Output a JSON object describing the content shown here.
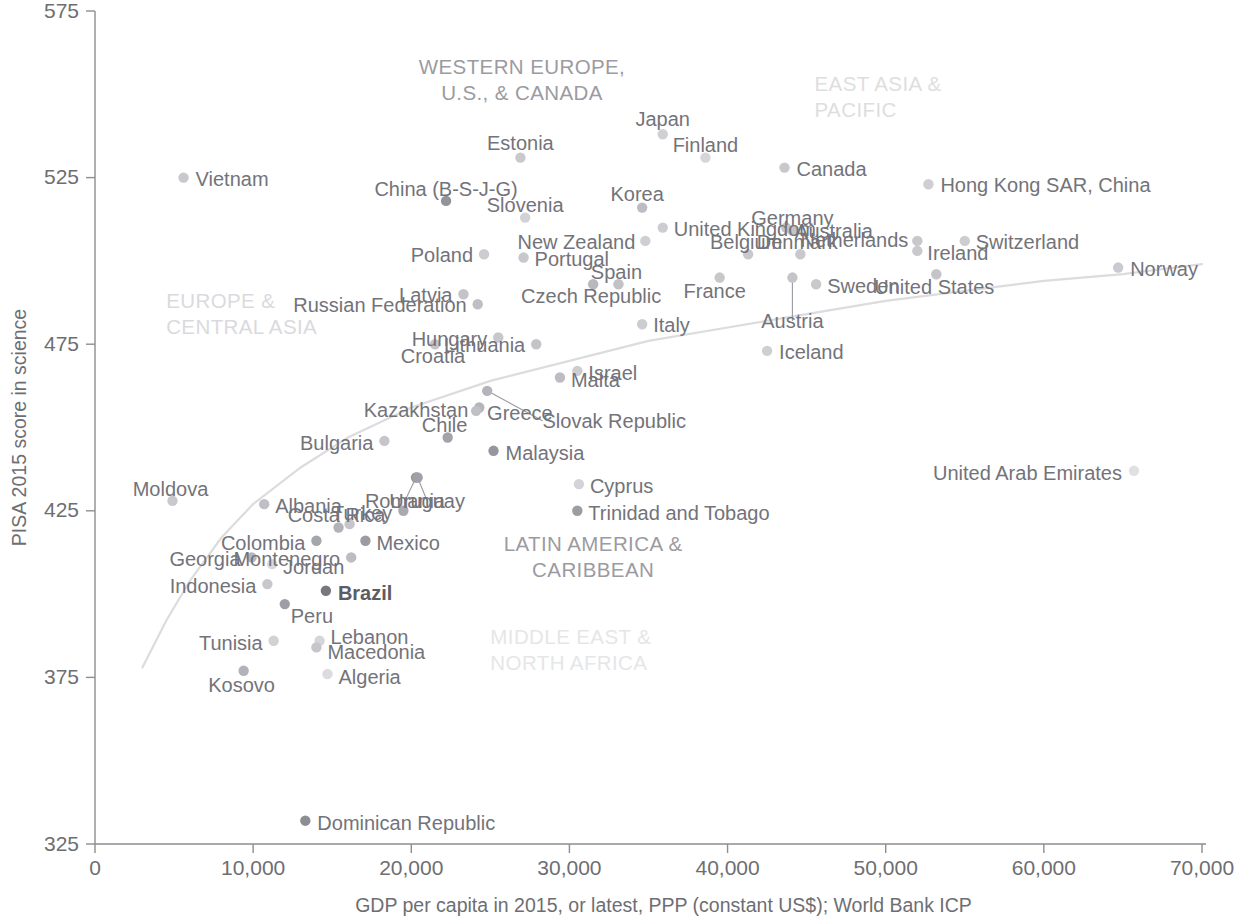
{
  "chart_data": {
    "type": "scatter",
    "title": "",
    "xlabel": "GDP per capita in 2015, or latest, PPP (constant US$); World Bank ICP",
    "ylabel": "PISA 2015 score in science",
    "xlim": [
      0,
      70000
    ],
    "ylim": [
      325,
      575
    ],
    "xticks": [
      "0",
      "10,000",
      "20,000",
      "30,000",
      "40,000",
      "50,000",
      "60,000",
      "70,000"
    ],
    "xtick_values": [
      0,
      10000,
      20000,
      30000,
      40000,
      50000,
      60000,
      70000
    ],
    "yticks": [
      "325",
      "375",
      "425",
      "475",
      "525",
      "575"
    ],
    "ytick_values": [
      325,
      375,
      425,
      475,
      525,
      575
    ],
    "grid": false,
    "legend": "none",
    "trend_line": {
      "label": "fitted logarithmic trend",
      "color": "#dcdcde",
      "points": [
        [
          3000,
          378
        ],
        [
          4500,
          392
        ],
        [
          6000,
          404
        ],
        [
          8000,
          417
        ],
        [
          10000,
          427
        ],
        [
          13000,
          438
        ],
        [
          16000,
          447
        ],
        [
          20000,
          456
        ],
        [
          25000,
          464
        ],
        [
          30000,
          470
        ],
        [
          35000,
          476
        ],
        [
          40000,
          480
        ],
        [
          45000,
          484
        ],
        [
          50000,
          488
        ],
        [
          55000,
          491
        ],
        [
          60000,
          494
        ],
        [
          65000,
          496
        ],
        [
          70000,
          499
        ]
      ]
    },
    "regions": [
      {
        "name": "WESTERN EUROPE, U.S., & CANADA",
        "lines": [
          "WESTERN EUROPE,",
          "U.S., & CANADA"
        ],
        "x": 27000,
        "y": 556,
        "color": "#9b9ba1",
        "align": "middle"
      },
      {
        "name": "EAST ASIA & PACIFIC",
        "lines": [
          "EAST ASIA &",
          "PACIFIC"
        ],
        "x": 45500,
        "y": 551,
        "color": "#dedee0",
        "align": "start"
      },
      {
        "name": "EUROPE & CENTRAL ASIA",
        "lines": [
          "EUROPE &",
          "CENTRAL ASIA"
        ],
        "x": 4500,
        "y": 486,
        "color": "#dadade",
        "align": "start"
      },
      {
        "name": "LATIN AMERICA & CARIBBEAN",
        "lines": [
          "LATIN AMERICA &",
          "CARIBBEAN"
        ],
        "x": 31500,
        "y": 413,
        "color": "#9b9ba1",
        "align": "middle"
      },
      {
        "name": "MIDDLE EAST & NORTH AFRICA",
        "lines": [
          "MIDDLE EAST &",
          "NORTH AFRICA"
        ],
        "x": 25000,
        "y": 385,
        "color": "#e6e6e8",
        "align": "start"
      }
    ],
    "points": [
      {
        "name": "Vietnam",
        "x": 5600,
        "y": 525,
        "shade": "#c9c9cd",
        "label_dx": 12,
        "label_dy": 1,
        "anchor": "start"
      },
      {
        "name": "Estonia",
        "x": 26900,
        "y": 531,
        "shade": "#c9c9cd",
        "label_dx": 0,
        "label_dy": -15,
        "anchor": "middle"
      },
      {
        "name": "Japan",
        "x": 35900,
        "y": 538,
        "shade": "#d0d0d4",
        "label_dx": 0,
        "label_dy": -15,
        "anchor": "middle"
      },
      {
        "name": "Canada",
        "x": 43600,
        "y": 528,
        "shade": "#c9c9cd",
        "label_dx": 12,
        "label_dy": 1,
        "anchor": "start"
      },
      {
        "name": "Finland",
        "x": 38600,
        "y": 531,
        "shade": "#d6d6da",
        "label_dx": 0,
        "label_dy": -13,
        "anchor": "middle"
      },
      {
        "name": "Hong Kong SAR, China",
        "x": 52700,
        "y": 523,
        "shade": "#cfcfd3",
        "label_dx": 12,
        "label_dy": 1,
        "anchor": "start"
      },
      {
        "name": "Korea",
        "x": 34600,
        "y": 516,
        "shade": "#bcbcc2",
        "label_dx": -5,
        "label_dy": -14,
        "anchor": "middle"
      },
      {
        "name": "United Kingdom",
        "x": 35900,
        "y": 510,
        "shade": "#cdcdd1",
        "label_dx": 11,
        "label_dy": 1,
        "anchor": "start"
      },
      {
        "name": "Slovenia",
        "x": 27200,
        "y": 513,
        "shade": "#d2d2d6",
        "label_dx": 0,
        "label_dy": -13,
        "anchor": "middle"
      },
      {
        "name": "China (B-S-J-G)",
        "x": 22200,
        "y": 518,
        "shade": "#939399",
        "label_dx": 0,
        "label_dy": -12,
        "anchor": "middle"
      },
      {
        "name": "Germany",
        "x": 44100,
        "y": 509,
        "shade": "#c3c3c8",
        "label_dx": 0,
        "label_dy": -13,
        "anchor": "middle"
      },
      {
        "name": "Australia",
        "x": 43700,
        "y": 510,
        "shade": "#c3c3c8",
        "label_dx": 9,
        "label_dy": 3,
        "anchor": "start"
      },
      {
        "name": "New Zealand",
        "x": 34800,
        "y": 506,
        "shade": "#cfcfd3",
        "label_dx": -10,
        "label_dy": 1,
        "anchor": "end"
      },
      {
        "name": "Netherlands",
        "x": 52000,
        "y": 506,
        "shade": "#c7c7cc",
        "label_dx": -9,
        "label_dy": -1,
        "anchor": "end"
      },
      {
        "name": "Switzerland",
        "x": 55000,
        "y": 506,
        "shade": "#cdcdd1",
        "label_dx": 11,
        "label_dy": 1,
        "anchor": "start"
      },
      {
        "name": "Portugal",
        "x": 27100,
        "y": 501,
        "shade": "#c7c7cc",
        "label_dx": 11,
        "label_dy": 1,
        "anchor": "start"
      },
      {
        "name": "Poland",
        "x": 24600,
        "y": 502,
        "shade": "#cdcdd1",
        "label_dx": -11,
        "label_dy": 1,
        "anchor": "end"
      },
      {
        "name": "Denmark",
        "x": 44600,
        "y": 502,
        "shade": "#c9c9cd",
        "label_dx": -3,
        "label_dy": -12,
        "anchor": "middle"
      },
      {
        "name": "Ireland",
        "x": 52000,
        "y": 503,
        "shade": "#c9c9cd",
        "label_dx": 10,
        "label_dy": 2,
        "anchor": "start"
      },
      {
        "name": "Belgium",
        "x": 41300,
        "y": 502,
        "shade": "#c9c9cd",
        "label_dx": -2,
        "label_dy": -12,
        "anchor": "middle"
      },
      {
        "name": "Spain",
        "x": 33100,
        "y": 493,
        "shade": "#c1c1c6",
        "label_dx": -2,
        "label_dy": -12,
        "anchor": "middle"
      },
      {
        "name": "Norway",
        "x": 64700,
        "y": 498,
        "shade": "#cacad0",
        "label_dx": 12,
        "label_dy": 1,
        "anchor": "start"
      },
      {
        "name": "United States",
        "x": 53200,
        "y": 496,
        "shade": "#c4c4c9",
        "label_dx": -2,
        "label_dy": 13,
        "anchor": "middle"
      },
      {
        "name": "Latvia",
        "x": 23300,
        "y": 490,
        "shade": "#c3c3c8",
        "label_dx": -11,
        "label_dy": 1,
        "anchor": "end"
      },
      {
        "name": "Russian Federation",
        "x": 24200,
        "y": 487,
        "shade": "#bebec4",
        "label_dx": -11,
        "label_dy": 1,
        "anchor": "end"
      },
      {
        "name": "Czech Republic",
        "x": 31500,
        "y": 493,
        "shade": "#b8b8be",
        "label_dx": -2,
        "label_dy": 12,
        "anchor": "middle"
      },
      {
        "name": "France",
        "x": 39500,
        "y": 495,
        "shade": "#c7c7cc",
        "label_dx": -5,
        "label_dy": 13,
        "anchor": "middle"
      },
      {
        "name": "Sweden",
        "x": 45600,
        "y": 493,
        "shade": "#c9c9cd",
        "label_dx": 11,
        "label_dy": 2,
        "anchor": "start"
      },
      {
        "name": "Austria",
        "x": 44100,
        "y": 495,
        "shade": "#c4c4c9",
        "label_dx": 0,
        "label_dy": 0,
        "anchor": "middle",
        "leader": {
          "to_x": 44100,
          "to_y": 482
        }
      },
      {
        "name": "Hungary",
        "x": 25500,
        "y": 477,
        "shade": "#c7c7cc",
        "label_dx": -11,
        "label_dy": 1,
        "anchor": "end"
      },
      {
        "name": "Italy",
        "x": 34600,
        "y": 481,
        "shade": "#cdcdd1",
        "label_dx": 11,
        "label_dy": 1,
        "anchor": "start"
      },
      {
        "name": "Lithuania",
        "x": 27900,
        "y": 475,
        "shade": "#c3c3c8",
        "label_dx": -11,
        "label_dy": 1,
        "anchor": "end"
      },
      {
        "name": "Croatia",
        "x": 21500,
        "y": 475,
        "shade": "#c3c3c8",
        "label_dx": -2,
        "label_dy": 12,
        "anchor": "middle"
      },
      {
        "name": "Iceland",
        "x": 42500,
        "y": 473,
        "shade": "#cfcfd3",
        "label_dx": 12,
        "label_dy": 1,
        "anchor": "start"
      },
      {
        "name": "Israel",
        "x": 30500,
        "y": 467,
        "shade": "#cdcdd1",
        "label_dx": 11,
        "label_dy": 2,
        "anchor": "start"
      },
      {
        "name": "Malta",
        "x": 29400,
        "y": 465,
        "shade": "#bcbcc2",
        "label_dx": 11,
        "label_dy": 2,
        "anchor": "start"
      },
      {
        "name": "Kazakhstan",
        "x": 24300,
        "y": 456,
        "shade": "#b4b4ba",
        "label_dx": -11,
        "label_dy": 2,
        "anchor": "end"
      },
      {
        "name": "Slovak Republic",
        "x": 24800,
        "y": 461,
        "shade": "#b4b4ba",
        "label_dx": 0,
        "label_dy": 0,
        "anchor": "start",
        "leader": {
          "to_x": 28300,
          "to_y": 452
        }
      },
      {
        "name": "Greece",
        "x": 24100,
        "y": 455,
        "shade": "#bfbfc5",
        "label_dx": 11,
        "label_dy": 2,
        "anchor": "start"
      },
      {
        "name": "Bulgaria",
        "x": 18300,
        "y": 446,
        "shade": "#c5c5ca",
        "label_dx": -11,
        "label_dy": 2,
        "anchor": "end"
      },
      {
        "name": "Chile",
        "x": 22300,
        "y": 447,
        "shade": "#a3a3aa",
        "label_dx": -3,
        "label_dy": -12,
        "anchor": "middle"
      },
      {
        "name": "Malaysia",
        "x": 25200,
        "y": 443,
        "shade": "#96969d",
        "label_dx": 12,
        "label_dy": 2,
        "anchor": "start"
      },
      {
        "name": "United Arab Emirates",
        "x": 65700,
        "y": 437,
        "shade": "#e0e0e2",
        "label_dx": -12,
        "label_dy": 2,
        "anchor": "end"
      },
      {
        "name": "Moldova",
        "x": 4900,
        "y": 428,
        "shade": "#c9c9cd",
        "label_dx": -2,
        "label_dy": -12,
        "anchor": "middle"
      },
      {
        "name": "Cyprus",
        "x": 30600,
        "y": 433,
        "shade": "#d4d4d8",
        "label_dx": 11,
        "label_dy": 2,
        "anchor": "start"
      },
      {
        "name": "Romania",
        "x": 20300,
        "y": 435,
        "shade": "#97979e",
        "label_dx": 0,
        "label_dy": 0,
        "anchor": "middle",
        "leader": {
          "to_x": 19600,
          "to_y": 428
        }
      },
      {
        "name": "Uruguay",
        "x": 20400,
        "y": 435,
        "shade": "#a0a0a7",
        "label_dx": 0,
        "label_dy": 0,
        "anchor": "middle",
        "leader": {
          "to_x": 21000,
          "to_y": 428
        }
      },
      {
        "name": "Albania",
        "x": 10700,
        "y": 427,
        "shade": "#bfbfc5",
        "label_dx": 11,
        "label_dy": 2,
        "anchor": "start"
      },
      {
        "name": "Trinidad and Tobago",
        "x": 30500,
        "y": 425,
        "shade": "#9c9ca3",
        "label_dx": 11,
        "label_dy": 2,
        "anchor": "start"
      },
      {
        "name": "Turkey",
        "x": 19500,
        "y": 425,
        "shade": "#a9a9b0",
        "label_dx": -11,
        "label_dy": 2,
        "anchor": "end"
      },
      {
        "name": "Costa Rica",
        "x": 15400,
        "y": 420,
        "shade": "#b2b2b9",
        "label_dx": -2,
        "label_dy": -12,
        "anchor": "middle"
      },
      {
        "name": "Thailand",
        "x": 16100,
        "y": 421,
        "shade": "#c5c5ca",
        "label_dx": 0,
        "label_dy": 0,
        "anchor": "middle",
        "hide_label": true
      },
      {
        "name": "Colombia",
        "x": 14000,
        "y": 416,
        "shade": "#a5a5ac",
        "label_dx": -11,
        "label_dy": 2,
        "anchor": "end"
      },
      {
        "name": "Mexico",
        "x": 17100,
        "y": 416,
        "shade": "#9b9ba2",
        "label_dx": 11,
        "label_dy": 2,
        "anchor": "start"
      },
      {
        "name": "Georgia",
        "x": 9900,
        "y": 411,
        "shade": "#b5b5bc",
        "label_dx": -11,
        "label_dy": 2,
        "anchor": "end"
      },
      {
        "name": "Jordan",
        "x": 11200,
        "y": 409,
        "shade": "#d8d8dc",
        "label_dx": 11,
        "label_dy": 3,
        "anchor": "start"
      },
      {
        "name": "Montenegro",
        "x": 16200,
        "y": 411,
        "shade": "#bcbcc2",
        "label_dx": -11,
        "label_dy": 2,
        "anchor": "end"
      },
      {
        "name": "Indonesia",
        "x": 10900,
        "y": 403,
        "shade": "#c7c7cc",
        "label_dx": -11,
        "label_dy": 2,
        "anchor": "end"
      },
      {
        "name": "Brazil",
        "x": 14600,
        "y": 401,
        "shade": "#77777e",
        "label_dx": 12,
        "label_dy": 2,
        "anchor": "start",
        "bold": true
      },
      {
        "name": "Peru",
        "x": 12000,
        "y": 397,
        "shade": "#9e9ea5",
        "label_dx": 6,
        "label_dy": 12,
        "anchor": "start"
      },
      {
        "name": "Lebanon",
        "x": 14200,
        "y": 386,
        "shade": "#d6d6da",
        "label_dx": 11,
        "label_dy": -4,
        "anchor": "start"
      },
      {
        "name": "Tunisia",
        "x": 11300,
        "y": 386,
        "shade": "#d2d2d6",
        "label_dx": -11,
        "label_dy": 2,
        "anchor": "end"
      },
      {
        "name": "Macedonia",
        "x": 14000,
        "y": 384,
        "shade": "#c5c5ca",
        "label_dx": 11,
        "label_dy": 5,
        "anchor": "start"
      },
      {
        "name": "Algeria",
        "x": 14700,
        "y": 376,
        "shade": "#dcdce0",
        "label_dx": 11,
        "label_dy": 3,
        "anchor": "start"
      },
      {
        "name": "Kosovo",
        "x": 9400,
        "y": 377,
        "shade": "#b2b2b9",
        "label_dx": -2,
        "label_dy": 14,
        "anchor": "middle"
      },
      {
        "name": "Dominican Republic",
        "x": 13300,
        "y": 332,
        "shade": "#8d8d94",
        "label_dx": 12,
        "label_dy": 2,
        "anchor": "start"
      }
    ]
  }
}
